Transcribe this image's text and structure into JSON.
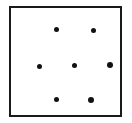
{
  "figure": {
    "background_color": "#ffffff",
    "ink_color": "#111111",
    "canvas": {
      "width": 132,
      "height": 123
    }
  },
  "frame": {
    "name": "square-border",
    "shape": "rectangle",
    "stroke_color": "#1a1a1a",
    "stroke_width": 2,
    "left": 9,
    "top": 6,
    "width": 113,
    "height": 111
  },
  "chart_data": {
    "type": "scatter",
    "xlabel": "",
    "ylabel": "",
    "grid": false,
    "legend": null,
    "xlim": [
      0,
      113
    ],
    "ylim": [
      0,
      111
    ],
    "marker": "filled-circle",
    "marker_color": "#111111",
    "point_count": 7,
    "rows": [
      {
        "name": "top-row",
        "count": 2
      },
      {
        "name": "middle-row",
        "count": 3
      },
      {
        "name": "bottom-row",
        "count": 2
      }
    ],
    "points": [
      {
        "id": "dot-top-left",
        "row": "top-row",
        "x": 47,
        "y": 23,
        "size": 5
      },
      {
        "id": "dot-top-right",
        "row": "top-row",
        "x": 84,
        "y": 24,
        "size": 5
      },
      {
        "id": "dot-middle-left",
        "row": "middle-row",
        "x": 30,
        "y": 60,
        "size": 5
      },
      {
        "id": "dot-middle-center",
        "row": "middle-row",
        "x": 65,
        "y": 59,
        "size": 5
      },
      {
        "id": "dot-middle-right",
        "row": "middle-row",
        "x": 101,
        "y": 59,
        "size": 6
      },
      {
        "id": "dot-bottom-left",
        "row": "bottom-row",
        "x": 47,
        "y": 93,
        "size": 5
      },
      {
        "id": "dot-bottom-right",
        "row": "bottom-row",
        "x": 82,
        "y": 94,
        "size": 6
      }
    ]
  }
}
